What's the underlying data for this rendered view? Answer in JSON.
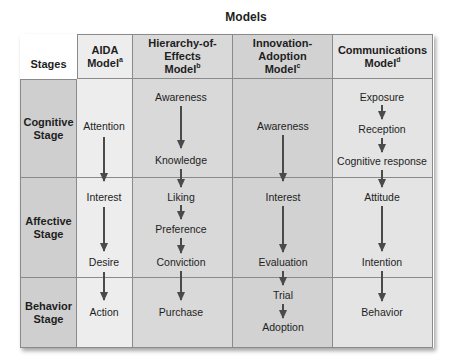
{
  "title": "Models",
  "stages_header": "Stages",
  "columns": [
    {
      "name": "AIDA",
      "line2": "Model",
      "note": "a"
    },
    {
      "name": "Hierarchy-of-Effects",
      "line2": "Model",
      "note": "b"
    },
    {
      "name": "Innovation-Adoption",
      "line2": "Model",
      "note": "c"
    },
    {
      "name": "Communications",
      "line2": "Model",
      "note": "d"
    }
  ],
  "stages": [
    {
      "line1": "Cognitive",
      "line2": "Stage"
    },
    {
      "line1": "Affective",
      "line2": "Stage"
    },
    {
      "line1": "Behavior",
      "line2": "Stage"
    }
  ],
  "aida": [
    "Attention",
    "Interest",
    "Desire",
    "Action"
  ],
  "hierarchy": [
    "Awareness",
    "Knowledge",
    "Liking",
    "Preference",
    "Conviction",
    "Purchase"
  ],
  "innovation": [
    "Awareness",
    "Interest",
    "Evaluation",
    "Trial",
    "Adoption"
  ],
  "communications": [
    "Exposure",
    "Reception",
    "Cognitive response",
    "Attitude",
    "Intention",
    "Behavior"
  ],
  "colors": {
    "stage_bg": "#cfcfcf",
    "aida_bg": "#ededed",
    "hoe_bg": "#d9d9d9",
    "ia_bg": "#d2d2d2",
    "comm_bg": "#e4e4e4",
    "arrow": "#4a4a4a",
    "grid": "#8a8a8a"
  }
}
